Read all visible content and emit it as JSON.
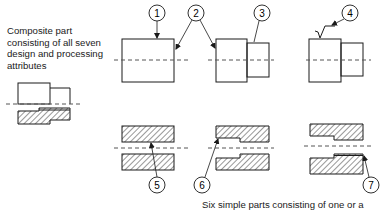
{
  "captions": {
    "composite": "Composite part consisting of all seven design and processing attributes",
    "simple": "Six simple parts consisting of one or a"
  },
  "callouts": [
    {
      "id": "1",
      "label": "1"
    },
    {
      "id": "2",
      "label": "2"
    },
    {
      "id": "3",
      "label": "3"
    },
    {
      "id": "4",
      "label": "4"
    },
    {
      "id": "5",
      "label": "5"
    },
    {
      "id": "6",
      "label": "6"
    },
    {
      "id": "7",
      "label": "7"
    }
  ],
  "colors": {
    "line": "#1a1a1a",
    "centerline": "#555555",
    "background": "#ffffff"
  }
}
